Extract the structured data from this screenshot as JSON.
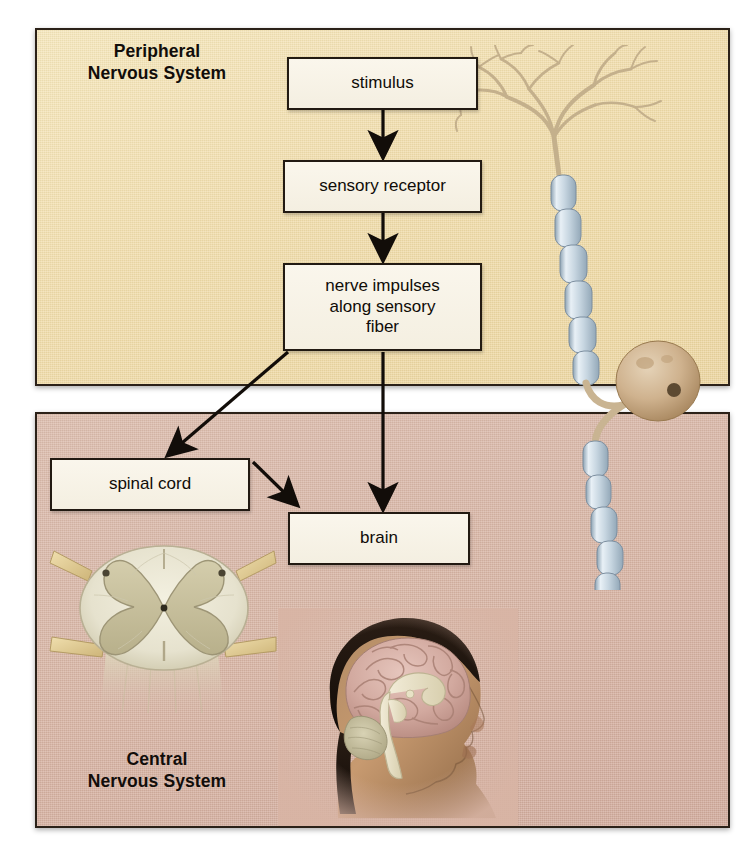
{
  "figure": {
    "panels": [
      {
        "id": "pns",
        "label": "Peripheral\nNervous System",
        "background_color": "#f1dca9"
      },
      {
        "id": "cns",
        "label": "Central\nNervous System",
        "background_color": "#d8b4a4"
      }
    ],
    "boxes": [
      {
        "id": "stimulus",
        "label": "stimulus",
        "panel": "pns"
      },
      {
        "id": "sensory_receptor",
        "label": "sensory receptor",
        "panel": "pns"
      },
      {
        "id": "nerve_impulses",
        "label": "nerve impulses\nalong sensory\nfiber",
        "panel": "pns"
      },
      {
        "id": "spinal_cord",
        "label": "spinal cord",
        "panel": "cns"
      },
      {
        "id": "brain",
        "label": "brain",
        "panel": "cns"
      }
    ],
    "flow": [
      {
        "from": "stimulus",
        "to": "sensory_receptor"
      },
      {
        "from": "sensory_receptor",
        "to": "nerve_impulses"
      },
      {
        "from": "nerve_impulses",
        "to": "spinal_cord"
      },
      {
        "from": "nerve_impulses",
        "to": "brain"
      },
      {
        "from": "spinal_cord",
        "to": "brain"
      }
    ],
    "illustrations": [
      {
        "id": "sensory-neuron",
        "name": "sensory neuron with myelinated axon",
        "panel": "pns"
      },
      {
        "id": "spinal-cord-cross-section",
        "name": "spinal cord cross section",
        "panel": "cns"
      },
      {
        "id": "head-brain-sagittal",
        "name": "sagittal section of head showing brain",
        "panel": "cns"
      }
    ],
    "colors": {
      "box_fill": "#f7f2e6",
      "box_border": "#221a12",
      "arrow": "#120d09",
      "text": "#100c08",
      "frame_border": "#2b2118"
    }
  }
}
